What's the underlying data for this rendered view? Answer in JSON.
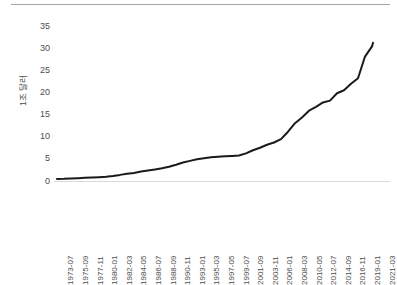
{
  "chart_data": {
    "type": "line",
    "title": "",
    "subtitle": "",
    "xlabel": "",
    "ylabel": "1조 달러",
    "ylim": [
      0,
      35
    ],
    "yticks": [
      0,
      5,
      10,
      15,
      20,
      25,
      30,
      35
    ],
    "ytick_labels": [
      "0",
      "5",
      "10",
      "15",
      "20",
      "25",
      "30",
      "35"
    ],
    "grid": false,
    "legend": null,
    "legend_position": "none",
    "line_color": "#1a1a1a",
    "line_width": 2,
    "axis_color": "#d9d9d9",
    "text_color": "#4d4d4d",
    "background": "#ffffff",
    "xtick_labels": [
      "1973-07",
      "1975-09",
      "1977-11",
      "1980-01",
      "1982-03",
      "1984-05",
      "1986-07",
      "1988-09",
      "1990-11",
      "1993-01",
      "1995-03",
      "1997-05",
      "1999-07",
      "2001-09",
      "2003-11",
      "2006-01",
      "2008-03",
      "2010-05",
      "2012-07",
      "2014-09",
      "2016-11",
      "2019-01",
      "2021-03"
    ],
    "series": [
      {
        "name": "송부채무",
        "x": [
          "1973-07",
          "1974-07",
          "1975-09",
          "1976-09",
          "1977-11",
          "1978-11",
          "1980-01",
          "1981-01",
          "1982-03",
          "1983-03",
          "1984-05",
          "1985-05",
          "1986-07",
          "1987-07",
          "1988-09",
          "1989-09",
          "1990-11",
          "1991-11",
          "1993-01",
          "1994-01",
          "1995-03",
          "1996-03",
          "1997-05",
          "1998-05",
          "1999-07",
          "2000-07",
          "2001-09",
          "2002-09",
          "2003-11",
          "2004-11",
          "2006-01",
          "2007-01",
          "2008-03",
          "2009-03",
          "2010-05",
          "2011-05",
          "2012-07",
          "2013-07",
          "2014-09",
          "2015-09",
          "2016-11",
          "2017-11",
          "2019-01",
          "2020-01",
          "2021-03",
          "2022-03"
        ],
        "values": [
          0.45,
          0.48,
          0.55,
          0.62,
          0.72,
          0.79,
          0.87,
          0.98,
          1.14,
          1.38,
          1.66,
          1.83,
          2.13,
          2.35,
          2.6,
          2.86,
          3.23,
          3.67,
          4.19,
          4.54,
          4.89,
          5.12,
          5.34,
          5.48,
          5.61,
          5.67,
          5.74,
          6.23,
          6.95,
          7.51,
          8.19,
          8.69,
          9.44,
          11.13,
          13.05,
          14.34,
          15.87,
          16.74,
          17.74,
          18.15,
          19.81,
          20.49,
          21.97,
          23.2,
          28.1,
          30.4
        ]
      }
    ],
    "data_end_value": 31.2,
    "note": "line rises gradually from ~0.45 in 1973-07 to ~5.7 plateau around 1999-2001, then accelerates after 2008, ending near 31.2"
  },
  "y_axis": {
    "title": "1조 달러",
    "ticks": [
      "35",
      "30",
      "25",
      "20",
      "15",
      "10",
      "5",
      "0"
    ]
  },
  "x_axis": {
    "ticks": [
      "1973-07",
      "1975-09",
      "1977-11",
      "1980-01",
      "1982-03",
      "1984-05",
      "1986-07",
      "1988-09",
      "1990-11",
      "1993-01",
      "1995-03",
      "1997-05",
      "1999-07",
      "2001-09",
      "2003-11",
      "2006-01",
      "2008-03",
      "2010-05",
      "2012-07",
      "2014-09",
      "2016-11",
      "2019-01",
      "2021-03"
    ]
  }
}
